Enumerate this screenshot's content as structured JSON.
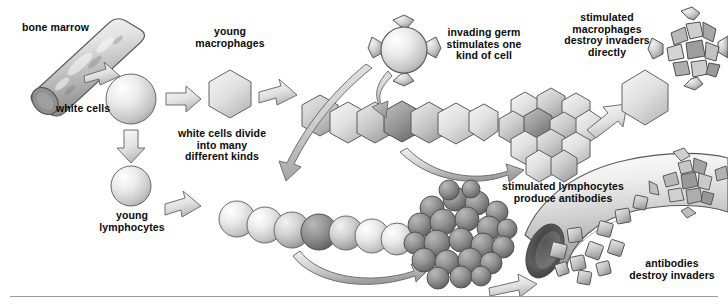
{
  "figure": {
    "background_color": "#ffffff",
    "text_color": "#0b0b0b",
    "divider_color": "#9b9b9b"
  },
  "labels": {
    "bone_marrow": "bone marrow",
    "white_cells": "white cells",
    "young_macrophages": "young\nmacrophages",
    "white_cells_divide": "white cells divide\ninto many\ndifferent kinds",
    "young_lymphocytes": "young\nlymphocytes",
    "invading_germ": "invading germ\nstimulates one\nkind of cell",
    "stimulated_macrophages": "stimulated\nmacrophages\ndestroy invaders\ndirectly",
    "stimulated_lymphocytes": "stimulated lymphocytes\nproduce antibodies",
    "antibodies_destroy": "antibodies\ndestroy invaders"
  },
  "structures": {
    "bone_marrow_cylinder": "mottled grey cylinder angled from lower-left to upper-right",
    "white_cell_sphere": "single large pale sphere",
    "young_macrophage_hexagon": "single pale hexagon",
    "young_lymphocyte_sphere": "single pale sphere",
    "macrophage_chain": "row of seven hexagons, one shaded darker",
    "lymphocyte_chain": "row of seven spheres, one shaded darker",
    "macrophage_cluster": "cluster of twelve hexagons",
    "lymphocyte_cluster": "dense cluster of dark grey spheres",
    "invading_germ": "sphere with four blunt spikes",
    "destroyed_germ": "fragmented spiked germ broken into plates",
    "blood_vessel": "curved open-ended tube containing square antibodies and a fragmented germ",
    "antibodies": "small grey squares"
  },
  "arrows": {
    "marrow_to_white_cell": "short block arrow, marrow to white cell sphere",
    "white_cell_to_macrophage": "block arrow right to young macrophage",
    "white_cell_to_lymphocyte": "block arrow down to young lymphocyte",
    "macrophage_to_chain": "block arrow right to macrophage chain",
    "lymphocyte_to_chain": "block arrow right to lymphocyte chain",
    "germ_to_macrophage_chain": "curved arrow down from invading germ to macrophage chain",
    "germ_to_lymphocyte_chain": "long curved arrow down-left to lymphocyte chain",
    "macrophage_chain_to_cluster": "curved arrow right to macrophage cluster",
    "lymphocyte_chain_to_cluster": "curved arrow right to lymphocyte cluster",
    "cluster_to_destroyed_germ": "block arrow up-right to destroyed germ",
    "lymphocyte_cluster_to_vessel": "block arrow right into blood vessel"
  },
  "colors": {
    "outline": "#4a4a4a",
    "fill_light": "#f0f0f0",
    "fill_mid": "#c9c9c9",
    "fill_dark": "#8d8d8d",
    "fill_darker": "#6e6e6e",
    "arrow_fill": "#e6e6e6",
    "arrow_stroke": "#6f6f6f"
  }
}
